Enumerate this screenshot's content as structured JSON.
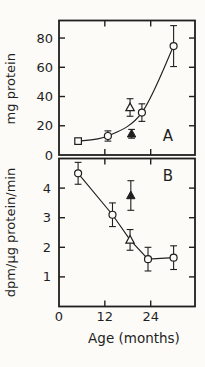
{
  "figure": {
    "background": "#fcfbf7",
    "ink": "#1f1f1f",
    "xaxis": {
      "label": "Age (months)",
      "tick_labels": [
        "0",
        "12",
        "24"
      ],
      "tick_values": [
        0,
        12,
        24
      ]
    }
  },
  "chart_data": [
    {
      "id": "A",
      "type": "scatter",
      "panel_label": "A",
      "title": "",
      "xlabel": "Age (months)",
      "ylabel": "mg protein",
      "ylim": [
        0,
        92
      ],
      "xlim": [
        0,
        35.6
      ],
      "yticks": [
        0,
        20,
        40,
        60,
        80
      ],
      "xticks": [
        12,
        24
      ],
      "grid": false,
      "legend_position": "none",
      "series": [
        {
          "name": "protein-curve",
          "connect": "curve",
          "points": [
            {
              "x": 5,
              "y": 9.5,
              "err": 1.5,
              "marker": "square-open"
            },
            {
              "x": 12.8,
              "y": 13,
              "err": 3.5,
              "marker": "circle-open"
            },
            {
              "x": 21.7,
              "y": 29,
              "err": 6,
              "marker": "circle-open"
            },
            {
              "x": 30,
              "y": 74.5,
              "err": 14,
              "marker": "circle-open"
            }
          ]
        },
        {
          "name": "open-triangle-point",
          "connect": "none",
          "points": [
            {
              "x": 18.6,
              "y": 32.5,
              "err": 6,
              "marker": "triangle-open"
            }
          ]
        },
        {
          "name": "filled-triangle-point",
          "connect": "none",
          "points": [
            {
              "x": 19,
              "y": 14.5,
              "err": 3,
              "marker": "triangle-filled"
            }
          ]
        }
      ]
    },
    {
      "id": "B",
      "type": "scatter",
      "panel_label": "B",
      "title": "",
      "xlabel": "Age (months)",
      "ylabel": "dpm/µg protein/min",
      "ylim": [
        0,
        5
      ],
      "xlim": [
        0,
        35.6
      ],
      "yticks": [
        1,
        2,
        3,
        4
      ],
      "xticks": [
        12,
        24
      ],
      "grid": false,
      "legend_position": "none",
      "series": [
        {
          "name": "specific-activity-line",
          "connect": "line",
          "points": [
            {
              "x": 5,
              "y": 4.5,
              "err": 0.37,
              "marker": "circle-open"
            },
            {
              "x": 14,
              "y": 3.1,
              "err": 0.4,
              "marker": "circle-open"
            },
            {
              "x": 18.6,
              "y": 2.25,
              "err": 0.35,
              "marker": "triangle-open"
            },
            {
              "x": 23.3,
              "y": 1.6,
              "err": 0.4,
              "marker": "circle-open"
            },
            {
              "x": 30,
              "y": 1.65,
              "err": 0.4,
              "marker": "circle-open"
            }
          ]
        },
        {
          "name": "filled-triangle-point",
          "connect": "none",
          "points": [
            {
              "x": 18.8,
              "y": 3.75,
              "err": 0.5,
              "marker": "triangle-filled"
            }
          ]
        }
      ]
    }
  ]
}
